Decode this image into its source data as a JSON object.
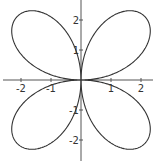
{
  "chart_data": {
    "type": "line",
    "title": "",
    "equation": "r = 3 sin(2θ)",
    "amplitude": 3,
    "k": 2,
    "xlabel": "",
    "ylabel": "",
    "xlim": [
      -2.6,
      2.4
    ],
    "ylim": [
      -2.7,
      2.7
    ],
    "x_ticks": [
      -2,
      -1,
      1,
      2
    ],
    "y_ticks": [
      2,
      1,
      -1,
      -2
    ],
    "x_tick_labels": [
      "-2",
      "-1",
      "1",
      "2"
    ],
    "y_tick_labels": [
      "2",
      "1",
      "-1",
      "-2"
    ],
    "grid": false,
    "legend": null,
    "colors": {
      "curve": "#333333",
      "axis": "#555555"
    }
  },
  "layout": {
    "origin_px": [
      81,
      80
    ],
    "scale_px_per_unit": 30
  }
}
